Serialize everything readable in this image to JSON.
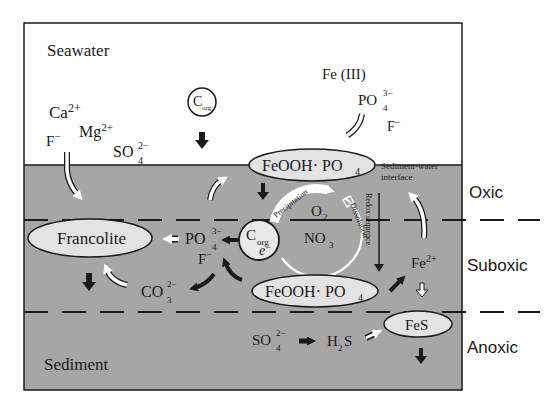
{
  "diagram": {
    "regions": {
      "seawater": "Seawater",
      "sediment": "Sediment"
    },
    "zones": {
      "oxic": "Oxic",
      "suboxic": "Suboxic",
      "anoxic": "Anoxic"
    },
    "interface_label": {
      "line1": "Sediment-water",
      "line2": "interface"
    },
    "seawater_species": {
      "ca": "Ca",
      "ca_charge": "2+",
      "mg": "Mg",
      "mg_charge": "2+",
      "f": "F",
      "f_charge": "−",
      "so": "SO",
      "so_sub": "4",
      "so_charge": "2−",
      "fe3": "Fe (III)",
      "po": "PO",
      "po_sub": "4",
      "po_charge": "3−",
      "f2": "F",
      "f2_charge": "−"
    },
    "corg_top": {
      "c": "C",
      "sub": "org"
    },
    "corg_mid": {
      "c": "C",
      "sub": "org",
      "e": "e",
      "e_charge": "−"
    },
    "ellipses": {
      "feooh_top": {
        "main": "FeOOH· PO",
        "sub": "4"
      },
      "feooh_bottom": {
        "main": "FeOOH· PO",
        "sub": "4"
      },
      "francolite": "Francolite",
      "fes": "FeS"
    },
    "sediment_species": {
      "po": "PO",
      "po_sub": "4",
      "po_charge": "3−",
      "f": "F",
      "f_charge": "−",
      "co": "CO",
      "co_sub": "3",
      "co_charge": "2−",
      "fe2": "Fe",
      "fe2_charge": "2+",
      "o2": "O",
      "o2_sub": "2",
      "no": "NO",
      "no_sub": "3",
      "so4": "SO",
      "so4_sub": "4",
      "so4_charge": "2−",
      "h2s_h": "H",
      "h2s_sub": "2",
      "h2s_s": "S"
    },
    "cycle_labels": {
      "precipitation": "Precipitation",
      "dissolution": "Dissolution",
      "redox": "Redox sequence"
    },
    "colors": {
      "sediment_fill": "#a6a6a6",
      "seawater_fill": "#ffffff",
      "ellipse_fill": "#e3e3e3",
      "line": "#1a1a1a"
    }
  }
}
